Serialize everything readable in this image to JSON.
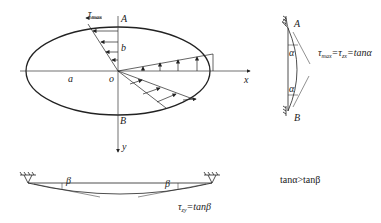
{
  "figure": {
    "ellipse_labels": {
      "tau_max": "τ",
      "tau_max_sub": "max",
      "A": "A",
      "B": "B",
      "a": "a",
      "b": "b",
      "o": "o",
      "x": "x",
      "y": "y"
    },
    "membrane_vertical": {
      "A": "A",
      "B": "B",
      "alpha1": "α",
      "alpha2": "α",
      "equation_tau": "τ",
      "equation_tau_sub": "max",
      "equation_mid": "=τ",
      "equation_mid_sub": "zx",
      "equation_rhs": "=tanα"
    },
    "membrane_horizontal": {
      "beta1": "β",
      "beta2": "β",
      "equation_tau": "τ",
      "equation_tau_sub": "zy",
      "equation_rhs": "=tanβ"
    },
    "comparison": "tanα>tanβ"
  }
}
